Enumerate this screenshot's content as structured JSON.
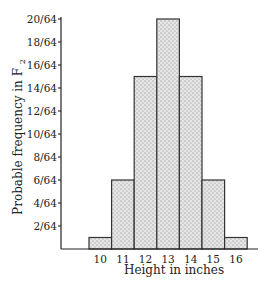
{
  "chart_data": {
    "type": "bar",
    "title": "",
    "xlabel": "Height in inches",
    "ylabel": "Probable frequency in F",
    "ylabel_subscript": "2",
    "categories": [
      "10",
      "11",
      "12",
      "13",
      "14",
      "15",
      "16"
    ],
    "values": [
      1,
      6,
      15,
      20,
      15,
      6,
      1
    ],
    "value_denominator": 64,
    "values_as_fraction": [
      "1/64",
      "6/64",
      "15/64",
      "20/64",
      "15/64",
      "6/64",
      "1/64"
    ],
    "yticks": [
      "2/64",
      "4/64",
      "6/64",
      "8/64",
      "10/64",
      "12/64",
      "14/64",
      "16/64",
      "18/64",
      "20/64"
    ],
    "ylim": [
      0,
      20
    ],
    "grid": false,
    "legend": null,
    "bar_style": "stippled gray histogram, adjacent bars"
  },
  "colors": {
    "bar_fill": "#d9d9d9",
    "stipple": "#7a7a7a",
    "outline": "#333333",
    "background": "#ffffff"
  }
}
